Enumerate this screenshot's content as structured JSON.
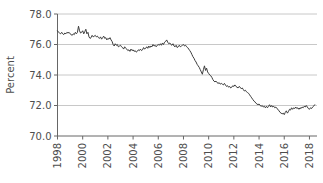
{
  "chart_data": {
    "type": "line",
    "title": "",
    "subtitle": "",
    "xlabel": "",
    "ylabel": "Percent",
    "ylim": [
      70.0,
      78.0
    ],
    "xlim": [
      1998.0,
      2018.6
    ],
    "grid": true,
    "grid_axis": "y",
    "legend": "none",
    "line_color": "#3c3c3c",
    "grid_color": "#c8c8c8",
    "axis_color": "#666666",
    "background_color": "#ffffff",
    "y_ticks": [
      "70.0",
      "72.0",
      "74.0",
      "76.0",
      "78.0"
    ],
    "y_tick_values": [
      70.0,
      72.0,
      74.0,
      76.0,
      78.0
    ],
    "x_ticks": [
      "1998",
      "2000",
      "2002",
      "2004",
      "2006",
      "2008",
      "2010",
      "2012",
      "2014",
      "2016",
      "2018"
    ],
    "x_tick_values": [
      1998,
      2000,
      2002,
      2004,
      2006,
      2008,
      2010,
      2012,
      2014,
      2016,
      2018
    ],
    "x_tick_rotation": 90,
    "series": [
      {
        "name": "Labor force participation rate",
        "x": [
          1998.0,
          1998.083,
          1998.167,
          1998.25,
          1998.333,
          1998.417,
          1998.5,
          1998.583,
          1998.667,
          1998.75,
          1998.833,
          1998.917,
          1999.0,
          1999.083,
          1999.167,
          1999.25,
          1999.333,
          1999.417,
          1999.5,
          1999.583,
          1999.667,
          1999.75,
          1999.833,
          1999.917,
          2000.0,
          2000.083,
          2000.167,
          2000.25,
          2000.333,
          2000.417,
          2000.5,
          2000.583,
          2000.667,
          2000.75,
          2000.833,
          2000.917,
          2001.0,
          2001.083,
          2001.167,
          2001.25,
          2001.333,
          2001.417,
          2001.5,
          2001.583,
          2001.667,
          2001.75,
          2001.833,
          2001.917,
          2002.0,
          2002.083,
          2002.167,
          2002.25,
          2002.333,
          2002.417,
          2002.5,
          2002.583,
          2002.667,
          2002.75,
          2002.833,
          2002.917,
          2003.0,
          2003.083,
          2003.167,
          2003.25,
          2003.333,
          2003.417,
          2003.5,
          2003.583,
          2003.667,
          2003.75,
          2003.833,
          2003.917,
          2004.0,
          2004.083,
          2004.167,
          2004.25,
          2004.333,
          2004.417,
          2004.5,
          2004.583,
          2004.667,
          2004.75,
          2004.833,
          2004.917,
          2005.0,
          2005.083,
          2005.167,
          2005.25,
          2005.333,
          2005.417,
          2005.5,
          2005.583,
          2005.667,
          2005.75,
          2005.833,
          2005.917,
          2006.0,
          2006.083,
          2006.167,
          2006.25,
          2006.333,
          2006.417,
          2006.5,
          2006.583,
          2006.667,
          2006.75,
          2006.833,
          2006.917,
          2007.0,
          2007.083,
          2007.167,
          2007.25,
          2007.333,
          2007.417,
          2007.5,
          2007.583,
          2007.667,
          2007.75,
          2007.833,
          2007.917,
          2008.0,
          2008.083,
          2008.167,
          2008.25,
          2008.333,
          2008.417,
          2008.5,
          2008.583,
          2008.667,
          2008.75,
          2008.833,
          2008.917,
          2009.0,
          2009.083,
          2009.167,
          2009.25,
          2009.333,
          2009.417,
          2009.5,
          2009.583,
          2009.667,
          2009.75,
          2009.833,
          2009.917,
          2010.0,
          2010.083,
          2010.167,
          2010.25,
          2010.333,
          2010.417,
          2010.5,
          2010.583,
          2010.667,
          2010.75,
          2010.833,
          2010.917,
          2011.0,
          2011.083,
          2011.167,
          2011.25,
          2011.333,
          2011.417,
          2011.5,
          2011.583,
          2011.667,
          2011.75,
          2011.833,
          2011.917,
          2012.0,
          2012.083,
          2012.167,
          2012.25,
          2012.333,
          2012.417,
          2012.5,
          2012.583,
          2012.667,
          2012.75,
          2012.833,
          2012.917,
          2013.0,
          2013.083,
          2013.167,
          2013.25,
          2013.333,
          2013.417,
          2013.5,
          2013.583,
          2013.667,
          2013.75,
          2013.833,
          2013.917,
          2014.0,
          2014.083,
          2014.167,
          2014.25,
          2014.333,
          2014.417,
          2014.5,
          2014.583,
          2014.667,
          2014.75,
          2014.833,
          2014.917,
          2015.0,
          2015.083,
          2015.167,
          2015.25,
          2015.333,
          2015.417,
          2015.5,
          2015.583,
          2015.667,
          2015.75,
          2015.833,
          2015.917,
          2016.0,
          2016.083,
          2016.167,
          2016.25,
          2016.333,
          2016.417,
          2016.5,
          2016.583,
          2016.667,
          2016.75,
          2016.833,
          2016.917,
          2017.0,
          2017.083,
          2017.167,
          2017.25,
          2017.333,
          2017.417,
          2017.5,
          2017.583,
          2017.667,
          2017.75,
          2017.833,
          2017.917,
          2018.0,
          2018.083,
          2018.167,
          2018.25,
          2018.333,
          2018.417
        ],
        "values": [
          76.9,
          76.8,
          76.75,
          76.7,
          76.8,
          76.7,
          76.65,
          76.75,
          76.7,
          76.8,
          76.75,
          76.8,
          76.7,
          76.65,
          76.6,
          76.7,
          76.65,
          76.8,
          76.7,
          76.8,
          77.2,
          76.9,
          76.75,
          76.8,
          76.9,
          76.7,
          76.85,
          77.0,
          76.7,
          76.8,
          76.5,
          76.4,
          76.45,
          76.6,
          76.5,
          76.55,
          76.6,
          76.5,
          76.55,
          76.45,
          76.4,
          76.5,
          76.35,
          76.45,
          76.55,
          76.4,
          76.45,
          76.3,
          76.4,
          76.35,
          76.45,
          76.3,
          76.2,
          76.0,
          75.9,
          76.05,
          75.95,
          76.0,
          75.85,
          75.9,
          75.95,
          75.85,
          75.8,
          75.7,
          75.85,
          75.75,
          75.7,
          75.6,
          75.65,
          75.55,
          75.7,
          75.6,
          75.65,
          75.55,
          75.6,
          75.5,
          75.55,
          75.65,
          75.6,
          75.7,
          75.6,
          75.65,
          75.8,
          75.7,
          75.75,
          75.85,
          75.75,
          75.9,
          75.8,
          75.9,
          75.85,
          76.0,
          75.9,
          75.95,
          75.85,
          75.95,
          76.0,
          75.95,
          76.05,
          75.95,
          76.1,
          76.0,
          76.15,
          76.2,
          76.3,
          76.15,
          76.05,
          76.1,
          76.0,
          75.95,
          76.05,
          75.9,
          75.85,
          75.95,
          75.8,
          75.85,
          75.95,
          75.85,
          75.9,
          75.95,
          76.0,
          75.9,
          75.95,
          75.85,
          75.8,
          75.7,
          75.6,
          75.5,
          75.35,
          75.2,
          75.1,
          74.95,
          74.85,
          74.7,
          74.6,
          74.5,
          74.35,
          74.2,
          74.05,
          74.35,
          74.6,
          74.3,
          74.45,
          74.2,
          74.1,
          74.0,
          73.95,
          73.85,
          73.7,
          73.6,
          73.55,
          73.6,
          73.5,
          73.45,
          73.5,
          73.4,
          73.45,
          73.4,
          73.35,
          73.45,
          73.35,
          73.25,
          73.3,
          73.2,
          73.25,
          73.15,
          73.2,
          73.3,
          73.25,
          73.35,
          73.25,
          73.2,
          73.15,
          73.25,
          73.2,
          73.1,
          73.15,
          73.05,
          72.95,
          73.0,
          72.9,
          72.85,
          72.8,
          72.7,
          72.6,
          72.5,
          72.4,
          72.3,
          72.25,
          72.15,
          72.1,
          72.05,
          72.1,
          72.0,
          71.95,
          72.0,
          71.9,
          71.95,
          71.85,
          71.95,
          71.85,
          71.95,
          72.05,
          71.9,
          72.0,
          71.9,
          71.95,
          71.85,
          71.9,
          71.8,
          71.75,
          71.65,
          71.55,
          71.5,
          71.45,
          71.5,
          71.4,
          71.55,
          71.65,
          71.5,
          71.6,
          71.75,
          71.7,
          71.85,
          71.75,
          71.85,
          71.8,
          71.9,
          71.8,
          71.85,
          71.75,
          71.85,
          71.8,
          71.9,
          71.85,
          71.95,
          71.9,
          72.0,
          71.9,
          71.8,
          71.75,
          71.85,
          71.8,
          71.9,
          71.95,
          72.05
        ]
      }
    ]
  },
  "axis": {
    "ylabel": "Percent"
  }
}
